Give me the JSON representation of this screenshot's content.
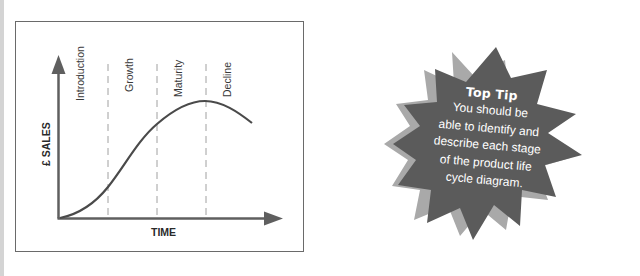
{
  "diagram": {
    "title": "Product life cycle",
    "y_axis_label": "£ SALES",
    "x_axis_label": "TIME",
    "stages": [
      {
        "label": "Introduction"
      },
      {
        "label": "Growth"
      },
      {
        "label": "Maturity"
      },
      {
        "label": "Decline"
      }
    ],
    "colors": {
      "axis": "#5f5f5f",
      "curve": "#4a4a4a",
      "divider": "#9a9a9a",
      "frame": "#6a6a6a"
    }
  },
  "top_tip": {
    "title": "Top Tip",
    "body_lines": [
      "You should be",
      "able to identify and",
      "describe each stage",
      "of the product life",
      "cycle diagram."
    ],
    "colors": {
      "burst": "#5b5b5b",
      "shadow": "#a9a9a9",
      "text": "#ffffff"
    }
  }
}
